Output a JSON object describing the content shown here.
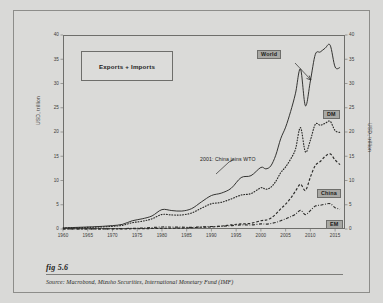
{
  "figure": {
    "number_label": "fig 5.6",
    "source_prefix": "Source:",
    "source_text": "Macrobond, Mizuho Securities, International Monetary Fund (IMF)"
  },
  "annotations": {
    "legend_box_label": "Exports + Imports",
    "wto_note": "2001: China joins WTO"
  },
  "colors": {
    "page_background": "#d9d9d7",
    "figure_background": "#dadad8",
    "frame": "#8d8d8a",
    "axis": "#6e6e6b",
    "series_line": "#2b2b29",
    "tag_background": "#a8a8a4",
    "text": "#1b1b1a"
  },
  "chart_data": {
    "type": "line",
    "title": "",
    "subtitle": "Exports + Imports",
    "xlabel": "",
    "ylabel": "USD, trillion",
    "ylabel_right": "USD, trillion",
    "xlim": [
      1960,
      2017
    ],
    "ylim": [
      0,
      40
    ],
    "yticks": [
      0,
      5,
      10,
      15,
      20,
      25,
      30,
      35,
      40
    ],
    "xticks": [
      1960,
      1965,
      1970,
      1975,
      1980,
      1985,
      1990,
      1995,
      2000,
      2005,
      2010,
      2015
    ],
    "grid": false,
    "legend_position": "inline-labels-right",
    "annotations": [
      {
        "text": "2001: China joins WTO",
        "x": 2001,
        "y": 13.0
      },
      {
        "text": "World",
        "x": 2008,
        "y": 33.0
      }
    ],
    "series": [
      {
        "name": "World",
        "style": "solid",
        "label": "World",
        "x": [
          1960,
          1962,
          1964,
          1966,
          1968,
          1970,
          1972,
          1974,
          1976,
          1978,
          1980,
          1982,
          1984,
          1986,
          1988,
          1990,
          1992,
          1994,
          1996,
          1998,
          2000,
          2001,
          2002,
          2003,
          2004,
          2005,
          2006,
          2007,
          2008,
          2009,
          2010,
          2011,
          2012,
          2013,
          2014,
          2015,
          2016
        ],
        "values": [
          0.25,
          0.3,
          0.38,
          0.45,
          0.55,
          0.7,
          0.95,
          1.7,
          2.1,
          2.7,
          4.0,
          3.8,
          3.7,
          4.2,
          5.6,
          6.9,
          7.4,
          8.4,
          10.6,
          11.0,
          12.7,
          12.4,
          13.0,
          15.2,
          18.6,
          21.0,
          24.2,
          28.0,
          33.0,
          25.4,
          30.5,
          36.0,
          36.5,
          37.3,
          37.9,
          33.4,
          33.3
        ]
      },
      {
        "name": "DM",
        "style": "dotted",
        "label": "DM",
        "x": [
          1960,
          1962,
          1964,
          1966,
          1968,
          1970,
          1972,
          1974,
          1976,
          1978,
          1980,
          1982,
          1984,
          1986,
          1988,
          1990,
          1992,
          1994,
          1996,
          1998,
          2000,
          2001,
          2002,
          2003,
          2004,
          2005,
          2006,
          2007,
          2008,
          2009,
          2010,
          2011,
          2012,
          2013,
          2014,
          2015,
          2016
        ],
        "values": [
          0.2,
          0.24,
          0.3,
          0.36,
          0.44,
          0.55,
          0.75,
          1.3,
          1.6,
          2.1,
          3.0,
          2.9,
          2.9,
          3.3,
          4.3,
          5.2,
          5.5,
          6.2,
          7.0,
          7.3,
          8.5,
          8.2,
          8.6,
          9.8,
          11.6,
          12.8,
          14.4,
          16.5,
          20.9,
          15.9,
          18.3,
          21.6,
          21.4,
          21.8,
          22.2,
          20.3,
          19.9
        ]
      },
      {
        "name": "China",
        "style": "dashed",
        "label": "China",
        "x": [
          1960,
          1965,
          1970,
          1975,
          1980,
          1982,
          1984,
          1986,
          1988,
          1990,
          1992,
          1994,
          1996,
          1998,
          2000,
          2001,
          2002,
          2003,
          2004,
          2005,
          2006,
          2007,
          2008,
          2009,
          2010,
          2011,
          2012,
          2013,
          2014,
          2015,
          2016
        ],
        "values": [
          0.04,
          0.05,
          0.06,
          0.15,
          0.38,
          0.42,
          0.53,
          0.74,
          1.03,
          1.15,
          1.66,
          2.37,
          2.9,
          3.24,
          4.74,
          5.1,
          6.21,
          8.51,
          11.55,
          14.22,
          17.6,
          21.74,
          25.63,
          22.08,
          29.74,
          36.42,
          38.67,
          41.6,
          43.03,
          39.53,
          36.86
        ]
      },
      {
        "name": "EM",
        "style": "dash-dot",
        "label": "EM",
        "x": [
          1960,
          1965,
          1970,
          1975,
          1980,
          1982,
          1984,
          1986,
          1988,
          1990,
          1992,
          1994,
          1996,
          1998,
          2000,
          2001,
          2002,
          2003,
          2004,
          2005,
          2006,
          2007,
          2008,
          2009,
          2010,
          2011,
          2012,
          2013,
          2014,
          2015,
          2016
        ],
        "values": [
          0.05,
          0.06,
          0.09,
          0.3,
          0.75,
          0.72,
          0.68,
          0.62,
          0.78,
          0.92,
          1.02,
          1.25,
          1.55,
          1.5,
          1.9,
          1.85,
          2.05,
          2.45,
          3.1,
          3.8,
          4.6,
          5.55,
          7.0,
          5.4,
          6.9,
          8.6,
          8.9,
          9.3,
          9.5,
          8.0,
          7.4
        ]
      }
    ]
  }
}
